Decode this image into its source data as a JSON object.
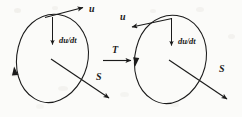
{
  "figure": {
    "type": "vector-loop-transformation-diagram",
    "background_color": "#fbfbf9",
    "ink_color": "#1b1b1b",
    "width": 242,
    "height": 117
  },
  "left_diagram": {
    "name": "left-loop-diagram",
    "loop_label": "",
    "circulation_arrow_direction": "upward",
    "labels": {
      "velocity": "u",
      "acceleration": "du/dt",
      "surface_vector": "S"
    },
    "velocity_arrow_direction": "up-right",
    "acceleration_arrow_direction": "down",
    "surface_arrow_direction": "down-right"
  },
  "transformation": {
    "name": "transformation-arrow",
    "label": "T",
    "direction": "right"
  },
  "right_diagram": {
    "name": "right-loop-diagram",
    "loop_label": "",
    "circulation_arrow_direction": "downward",
    "labels": {
      "velocity": "u",
      "acceleration": "du/dt",
      "surface_vector": "S"
    },
    "velocity_arrow_direction": "up-left",
    "acceleration_arrow_direction": "down",
    "surface_arrow_direction": "down-right"
  }
}
